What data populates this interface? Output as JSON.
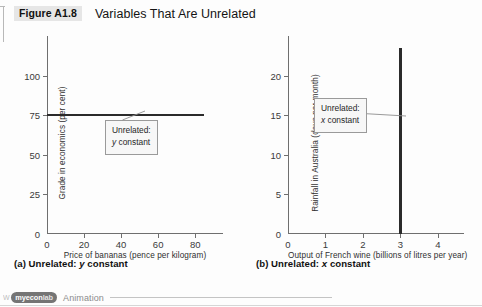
{
  "header": {
    "figure_number": "Figure A1.8",
    "title": "Variables That Are Unrelated"
  },
  "panel_a": {
    "caption_prefix": "(a) Unrelated: ",
    "caption_var": "y",
    "caption_suffix": " constant",
    "callout_line1": "Unrelated:",
    "callout_var": "y",
    "callout_line2": " constant"
  },
  "panel_b": {
    "caption_prefix": "(b) Unrelated: ",
    "caption_var": "x",
    "caption_suffix": " constant",
    "callout_line1": "Unrelated:",
    "callout_var": "x",
    "callout_line2": " constant"
  },
  "footer": {
    "watermark": "W",
    "badge_main": "myecon",
    "badge_suffix": "lab",
    "label": "Animation"
  },
  "colors": {
    "series": "#2b2b2b",
    "axis": "#6f6f6f",
    "callout_border": "#9a9a9a",
    "callout_fill": "#f7f7f7",
    "figure_number_band": "#e6e6e6"
  },
  "chart_data": [
    {
      "type": "line",
      "title": "(a) Unrelated: y constant",
      "xlabel": "Price of bananas (pence per kilogram)",
      "ylabel": "Grade in economics (per cent)",
      "xlim": [
        0,
        95
      ],
      "ylim": [
        0,
        125
      ],
      "xticks": [
        0,
        20,
        40,
        60,
        80
      ],
      "yticks": [
        0,
        25,
        50,
        75,
        100
      ],
      "grid": false,
      "legend": "none",
      "annotations": [
        "Unrelated: y constant"
      ],
      "series": [
        {
          "name": "Grade in economics vs price of bananas",
          "x": [
            0,
            85
          ],
          "y": [
            75,
            75
          ]
        }
      ]
    },
    {
      "type": "line",
      "title": "(b) Unrelated: x constant",
      "xlabel": "Output of French wine (billions of litres per year)",
      "ylabel": "Rainfall in Australia (days per month)",
      "xlim": [
        0,
        4.7
      ],
      "ylim": [
        0,
        25
      ],
      "xticks": [
        0,
        1,
        2,
        3,
        4
      ],
      "yticks": [
        0,
        5,
        10,
        15,
        20
      ],
      "grid": false,
      "legend": "none",
      "annotations": [
        "Unrelated: x constant"
      ],
      "series": [
        {
          "name": "Rainfall in Australia vs output of French wine",
          "x": [
            3,
            3
          ],
          "y": [
            0,
            23.5
          ]
        }
      ]
    }
  ]
}
